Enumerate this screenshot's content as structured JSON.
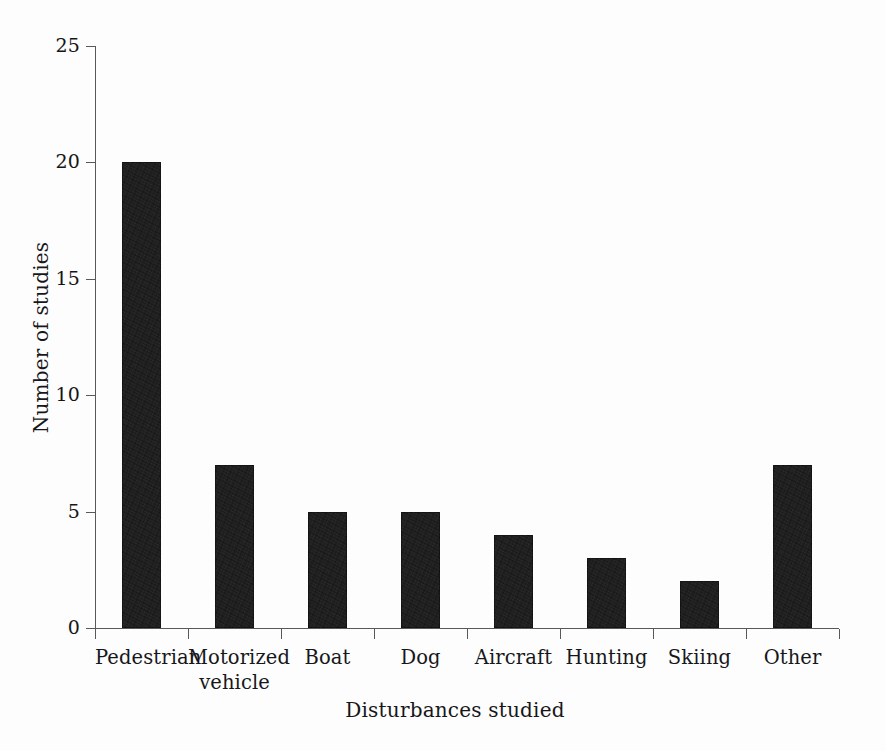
{
  "chart_data": {
    "type": "bar",
    "title": "",
    "xlabel": "Disturbances studied",
    "ylabel": "Number of studies",
    "categories": [
      "Pedestrian",
      "Motorized\nvehicle",
      "Boat",
      "Dog",
      "Aircraft",
      "Hunting",
      "Skiing",
      "Other"
    ],
    "values": [
      20,
      7,
      5,
      5,
      4,
      3,
      2,
      7
    ],
    "ylim": [
      0,
      25
    ],
    "yticks": [
      0,
      5,
      10,
      15,
      20,
      25
    ],
    "ytick_labels": [
      "0",
      "5",
      "10",
      "15",
      "20",
      "25"
    ],
    "grid": false,
    "legend": false,
    "bar_color": "#171717",
    "axis_color": "#58585a",
    "background_color": "#fdfdfd"
  },
  "axes": {
    "y_title": "Number of studies",
    "x_title": "Disturbances studied"
  }
}
